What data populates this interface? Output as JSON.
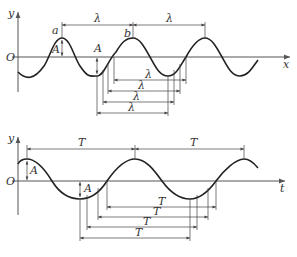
{
  "diagram": {
    "top": {
      "title": "Wave graph (displacement vs position)",
      "y_axis_label": "y",
      "x_axis_label": "x",
      "origin_label": "O",
      "point_a_label": "a",
      "point_b_label": "b",
      "amplitude_label": "A",
      "amplitude_label_2": "A",
      "top_wavelength_labels": [
        "λ",
        "λ"
      ],
      "stacked_wavelength_labels": [
        "λ",
        "λ",
        "λ",
        "λ"
      ]
    },
    "bottom": {
      "title": "Vibration graph (displacement vs time)",
      "y_axis_label": "y",
      "x_axis_label": "t",
      "origin_label": "O",
      "amplitude_label": "A",
      "amplitude_label_2": "A",
      "top_period_labels": [
        "T",
        "T"
      ],
      "stacked_period_labels": [
        "T",
        "T",
        "T",
        "T"
      ]
    },
    "colors": {
      "curve": "#222222",
      "axis": "#555555",
      "background": "#ffffff"
    }
  }
}
